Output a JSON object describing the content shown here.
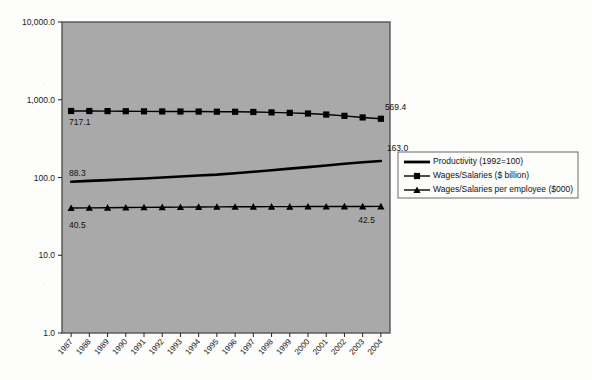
{
  "chart_data": {
    "type": "line",
    "title": "",
    "xlabel": "",
    "ylabel": "",
    "log_scale": true,
    "ylim": [
      1.0,
      10000.0
    ],
    "grid": false,
    "legend_position": "right-middle",
    "y_ticks": [
      "1.0",
      "10.0",
      "100.0",
      "1,000.0",
      "10,000.0"
    ],
    "y_tick_values": [
      1.0,
      10.0,
      100.0,
      1000.0,
      10000.0
    ],
    "categories": [
      "1987",
      "1988",
      "1989",
      "1990",
      "1991",
      "1992",
      "1993",
      "1994",
      "1995",
      "1996",
      "1997",
      "1998",
      "1999",
      "2000",
      "2001",
      "2002",
      "2003",
      "2004"
    ],
    "series": [
      {
        "name": "Productivity (1992=100)",
        "marker": "none",
        "color": "#000000",
        "values": [
          88.3,
          90.5,
          92.4,
          94.8,
          96.9,
          100.0,
          103.2,
          106.0,
          108.9,
          113.5,
          118.4,
          124.0,
          130.1,
          135.9,
          142.4,
          150.3,
          157.1,
          163.0
        ],
        "start_label": "88.3",
        "end_label": "163.0"
      },
      {
        "name": "Wages/Salaries ($ billion)",
        "marker": "square",
        "color": "#000000",
        "values": [
          717.1,
          716.2,
          714.0,
          712.8,
          709.5,
          707.4,
          706.0,
          704.8,
          702.1,
          700.3,
          696.5,
          688.2,
          678.4,
          665.1,
          645.3,
          620.7,
          592.4,
          569.4
        ],
        "start_label": "717.1",
        "end_label": "569.4"
      },
      {
        "name": "Wages/Salaries per employee ($000)",
        "marker": "triangle",
        "color": "#000000",
        "values": [
          40.5,
          40.7,
          40.9,
          41.1,
          41.3,
          41.5,
          41.6,
          41.8,
          41.9,
          42.0,
          42.1,
          42.2,
          42.2,
          42.3,
          42.3,
          42.4,
          42.4,
          42.5
        ],
        "start_label": "40.5",
        "end_label": "42.5"
      }
    ]
  },
  "plot": {
    "background_color": "#a9a9a9",
    "border_color": "#4a4a4a",
    "page_background": "#fdfdfc"
  },
  "legend": {
    "items": [
      {
        "label": "Productivity (1992=100)",
        "marker": "none"
      },
      {
        "label": "Wages/Salaries ($ billion)",
        "marker": "square"
      },
      {
        "label": "Wages/Salaries per employee ($000)",
        "marker": "triangle"
      }
    ]
  }
}
